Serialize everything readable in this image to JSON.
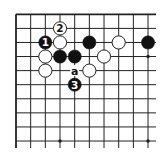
{
  "diagram": {
    "type": "go-board-fragment",
    "grid": {
      "cols": 10,
      "rows": 10,
      "origin_x": 16,
      "origin_y": 14.3,
      "spacing_x": 14.67,
      "spacing_y": 14.08,
      "edges": {
        "top": true,
        "left": true,
        "right": false,
        "bottom": false
      }
    },
    "colors": {
      "background": "#ffffff",
      "line": "#222222",
      "black_stone": "#111111",
      "white_stone": "#ffffff",
      "stone_outline": "#222222"
    },
    "star_points": [
      {
        "col": 9,
        "row": 3
      },
      {
        "col": 3,
        "row": 9
      },
      {
        "col": 9,
        "row": 9
      }
    ],
    "stones": [
      {
        "col": 2,
        "row": 2,
        "color": "black",
        "label": "1"
      },
      {
        "col": 3,
        "row": 1,
        "color": "white",
        "label": "2"
      },
      {
        "col": 4,
        "row": 5,
        "color": "black",
        "label": "3"
      },
      {
        "col": 3,
        "row": 2,
        "color": "white",
        "label": ""
      },
      {
        "col": 5,
        "row": 2,
        "color": "black",
        "label": ""
      },
      {
        "col": 7,
        "row": 2,
        "color": "white",
        "label": ""
      },
      {
        "col": 9,
        "row": 2,
        "color": "black",
        "label": ""
      },
      {
        "col": 2,
        "row": 3,
        "color": "white",
        "label": ""
      },
      {
        "col": 3,
        "row": 3,
        "color": "black",
        "label": ""
      },
      {
        "col": 4,
        "row": 3,
        "color": "black",
        "label": ""
      },
      {
        "col": 6,
        "row": 3,
        "color": "white",
        "label": ""
      },
      {
        "col": 2,
        "row": 4,
        "color": "white",
        "label": ""
      },
      {
        "col": 5,
        "row": 4,
        "color": "white",
        "label": ""
      }
    ],
    "marks": [
      {
        "col": 4,
        "row": 4,
        "text": "a"
      }
    ]
  }
}
